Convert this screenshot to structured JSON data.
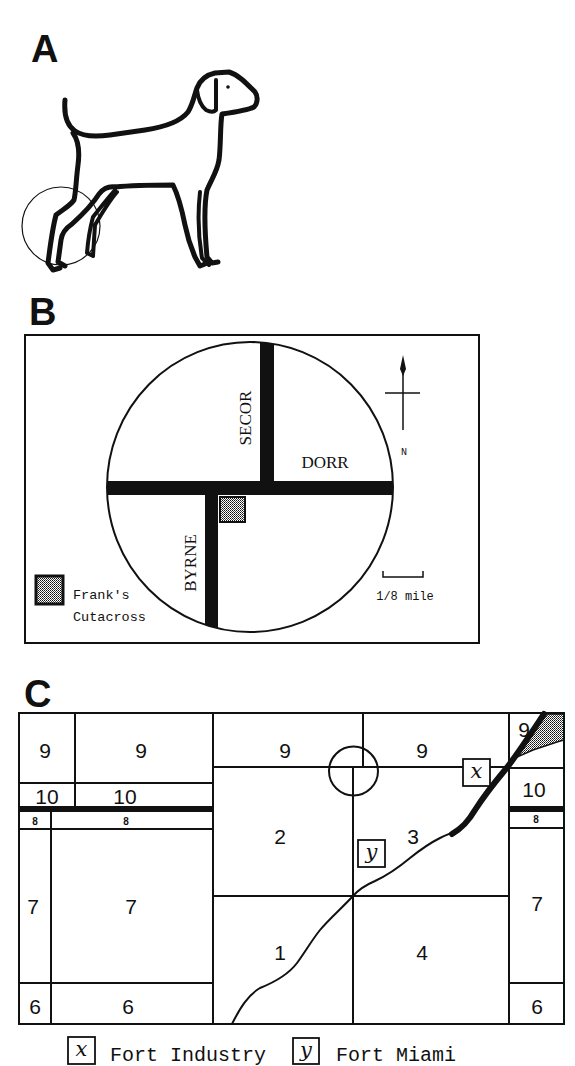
{
  "figure": {
    "panel_a": {
      "label": "A",
      "subject": "dog-outline",
      "highlight": "circle around hind legs"
    },
    "panel_b": {
      "label": "B",
      "streets": {
        "secor": "SECOR",
        "dorr": "DORR",
        "byrne": "BYRNE"
      },
      "compass": {
        "north_label": "N"
      },
      "scale": {
        "label": "1/8 mile"
      },
      "legend": {
        "line1": "Frank's",
        "line2": "Cutacross"
      }
    },
    "panel_c": {
      "label": "C",
      "sections": [
        {
          "id": "left-narrow-9",
          "label": "9"
        },
        {
          "id": "left-wide-9",
          "label": "9"
        },
        {
          "id": "left-narrow-10",
          "label": "10"
        },
        {
          "id": "left-wide-10",
          "label": "10"
        },
        {
          "id": "left-narrow-8",
          "label": "8"
        },
        {
          "id": "left-wide-8",
          "label": "8"
        },
        {
          "id": "left-narrow-7",
          "label": "7"
        },
        {
          "id": "left-wide-7",
          "label": "7"
        },
        {
          "id": "left-narrow-6",
          "label": "6"
        },
        {
          "id": "left-wide-6",
          "label": "6"
        },
        {
          "id": "center-left-9",
          "label": "9"
        },
        {
          "id": "center-right-9",
          "label": "9"
        },
        {
          "id": "center-2",
          "label": "2"
        },
        {
          "id": "center-3",
          "label": "3"
        },
        {
          "id": "center-1",
          "label": "1"
        },
        {
          "id": "center-4",
          "label": "4"
        },
        {
          "id": "right-9",
          "label": "9"
        },
        {
          "id": "right-10",
          "label": "10"
        },
        {
          "id": "right-8",
          "label": "8"
        },
        {
          "id": "right-7",
          "label": "7"
        },
        {
          "id": "right-6",
          "label": "6"
        }
      ],
      "markers": {
        "x": "x",
        "y": "y"
      },
      "legend": [
        {
          "marker": "x",
          "label": "Fort Industry"
        },
        {
          "marker": "y",
          "label": "Fort Miami"
        }
      ]
    }
  },
  "colors": {
    "ink": "#111111",
    "paper": "#ffffff"
  }
}
